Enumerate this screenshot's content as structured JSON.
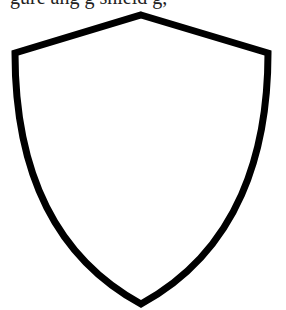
{
  "caption": {
    "text": "gure ang g shield g,",
    "clipped": true
  },
  "shield": {
    "stroke_color": "#000000",
    "fill_color": "#ffffff",
    "stroke_width": 7,
    "points": {
      "top": [
        141,
        15
      ],
      "left_corner": [
        15,
        53
      ],
      "right_corner": [
        268,
        53
      ],
      "bottom": [
        141,
        304
      ]
    }
  }
}
